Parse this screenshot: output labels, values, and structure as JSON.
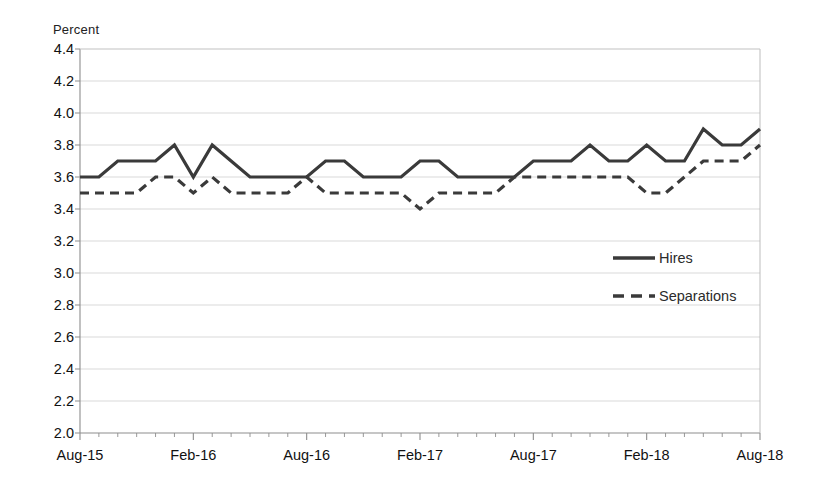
{
  "axis_unit_label": "Percent",
  "chart_data": {
    "type": "line",
    "title": "",
    "subtitle": "",
    "xlabel": "",
    "ylabel": "Percent",
    "ylim": [
      2.0,
      4.4
    ],
    "ytick_step": 0.2,
    "ytick_labels": [
      "4.4",
      "4.2",
      "4.0",
      "3.8",
      "3.6",
      "3.4",
      "3.2",
      "3.0",
      "2.8",
      "2.6",
      "2.4",
      "2.2",
      "2.0"
    ],
    "ytick_values": [
      4.4,
      4.2,
      4.0,
      3.8,
      3.6,
      3.4,
      3.2,
      3.0,
      2.8,
      2.6,
      2.4,
      2.2,
      2.0
    ],
    "grid": true,
    "grid_axis": "y",
    "legend_position": "inside-right",
    "xtick_labels": [
      "Aug-15",
      "Feb-16",
      "Aug-16",
      "Feb-17",
      "Aug-17",
      "Feb-18",
      "Aug-18"
    ],
    "xtick_indices": [
      0,
      6,
      12,
      18,
      24,
      30,
      36
    ],
    "x": [
      "Aug-15",
      "Sep-15",
      "Oct-15",
      "Nov-15",
      "Dec-15",
      "Jan-16",
      "Feb-16",
      "Mar-16",
      "Apr-16",
      "May-16",
      "Jun-16",
      "Jul-16",
      "Aug-16",
      "Sep-16",
      "Oct-16",
      "Nov-16",
      "Dec-16",
      "Jan-17",
      "Feb-17",
      "Mar-17",
      "Apr-17",
      "May-17",
      "Jun-17",
      "Jul-17",
      "Aug-17",
      "Sep-17",
      "Oct-17",
      "Nov-17",
      "Dec-17",
      "Jan-18",
      "Feb-18",
      "Mar-18",
      "Apr-18",
      "May-18",
      "Jun-18",
      "Jul-18",
      "Aug-18"
    ],
    "series": [
      {
        "name": "Hires",
        "style": "solid",
        "color": "#3a3a3a",
        "values": [
          3.6,
          3.6,
          3.7,
          3.7,
          3.7,
          3.8,
          3.6,
          3.8,
          3.7,
          3.6,
          3.6,
          3.6,
          3.6,
          3.7,
          3.7,
          3.6,
          3.6,
          3.6,
          3.7,
          3.7,
          3.6,
          3.6,
          3.6,
          3.6,
          3.7,
          3.7,
          3.7,
          3.8,
          3.7,
          3.7,
          3.8,
          3.7,
          3.7,
          3.9,
          3.8,
          3.8,
          3.9
        ]
      },
      {
        "name": "Separations",
        "style": "dashed",
        "color": "#3a3a3a",
        "values": [
          3.5,
          3.5,
          3.5,
          3.5,
          3.6,
          3.6,
          3.5,
          3.6,
          3.5,
          3.5,
          3.5,
          3.5,
          3.6,
          3.5,
          3.5,
          3.5,
          3.5,
          3.5,
          3.4,
          3.5,
          3.5,
          3.5,
          3.5,
          3.6,
          3.6,
          3.6,
          3.6,
          3.6,
          3.6,
          3.6,
          3.5,
          3.5,
          3.6,
          3.7,
          3.7,
          3.7,
          3.8
        ]
      }
    ]
  },
  "legend": {
    "items": [
      {
        "label": "Hires",
        "style": "solid"
      },
      {
        "label": "Separations",
        "style": "dashed"
      }
    ]
  }
}
